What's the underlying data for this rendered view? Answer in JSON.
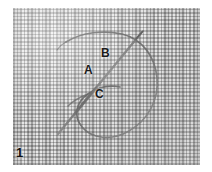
{
  "figure": {
    "number": "1",
    "caption_labels": {
      "a": "A",
      "b": "B",
      "c": "C"
    },
    "background": {
      "material": "woven-linen-fabric",
      "swatch_color": "#e9e9e9",
      "weave_thread_color": "#787878"
    },
    "elements": {
      "thread_loop": {
        "name": "thread-loop",
        "color": "#6e6e6e",
        "stroke_width": "1.6"
      },
      "needle": {
        "name": "needle",
        "color": "#707070",
        "stroke_width": "2.2"
      }
    },
    "page_background": "#ffffff"
  }
}
